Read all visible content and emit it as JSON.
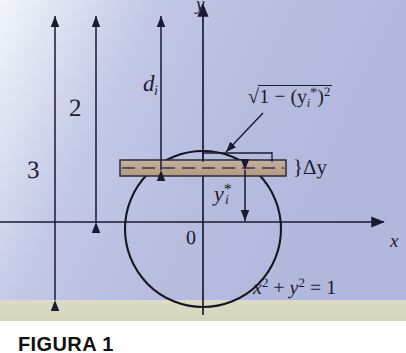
{
  "figure": {
    "caption": "FIGURA 1",
    "background_sky": "#b9bee0",
    "background_ground": "#d8d8c0",
    "ink": "#1a1a33",
    "strip_fill": "#c0a893",
    "axes": {
      "x_label": "x",
      "y_label": "y",
      "origin_label": "0"
    },
    "labels": {
      "depth_total": "3",
      "depth_to_axis": "2",
      "d_i": "d",
      "d_i_sub": "i",
      "half_width_radical": "1 − (y",
      "half_width_sub": "i",
      "half_width_star": "*",
      "half_width_close": ")",
      "half_width_power": "2",
      "radical_sign": "√",
      "delta_y_brace": "}",
      "delta_y": "Δy",
      "y_star": "y",
      "y_star_sub": "i",
      "y_star_mark": "*",
      "circle_equation_x": "x",
      "circle_equation_pow": "2",
      "circle_equation_plus": " + ",
      "circle_equation_y": "y",
      "circle_equation_eq": " = 1"
    },
    "geometry": {
      "circle_center_x": 203,
      "circle_center_y": 229,
      "circle_radius": 78,
      "x_axis_y": 222,
      "y_axis_x": 203,
      "strip_left": 120,
      "strip_right": 286,
      "strip_top": 160,
      "strip_bottom": 176,
      "ground_top": 300,
      "arrow_3_x": 55,
      "arrow_2_x": 96,
      "arrow_di_x": 161,
      "arrow_top_y": 15,
      "arrow_3_bottom": 300,
      "arrow_2_bottom": 222,
      "arrow_di_bottom": 168,
      "y_star_arrow_x": 245,
      "chord_marker_left": 203,
      "chord_marker_right": 272
    },
    "equation_text": {
      "circle": "x² + y² = 1",
      "half_width": "√(1 − (yᵢ*)²)",
      "delta": "Δy"
    }
  }
}
